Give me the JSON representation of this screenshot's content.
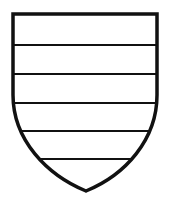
{
  "figure": {
    "division": "barry of six",
    "bar_count": 5,
    "colors": {
      "stroke": "#111111",
      "field": "#ffffff"
    }
  }
}
